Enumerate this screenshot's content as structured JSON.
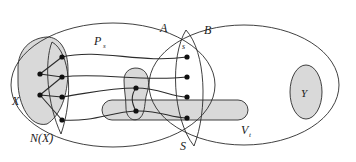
{
  "figure": {
    "type": "diagram",
    "width": 356,
    "height": 162,
    "background": "#ffffff"
  },
  "colors": {
    "stroke": "#2b2b2b",
    "fill_shaded": "#d9d9d9",
    "fill_none": "none",
    "vertex": "#111111",
    "label": "#1a1a1a"
  },
  "labels": {
    "set_a": "A",
    "set_b": "B",
    "set_x": "X",
    "set_nx": "N(X)",
    "set_s": "S",
    "set_y": "Y",
    "path_ps": "P",
    "path_ps_sub": "s",
    "vertex_s": "s",
    "set_vt": "V",
    "set_vt_sub": "t"
  },
  "regions": [
    {
      "id": "A",
      "label": "A",
      "shape": "ellipse",
      "shaded": false
    },
    {
      "id": "B",
      "label": "B",
      "shape": "ellipse",
      "shaded": false
    },
    {
      "id": "X",
      "label": "X",
      "shape": "blob",
      "shaded": true
    },
    {
      "id": "N(X)",
      "label": "N(X)",
      "shape": "lens",
      "shaded": false
    },
    {
      "id": "S",
      "label": "S",
      "shape": "lens",
      "shaded": false
    },
    {
      "id": "Y",
      "label": "Y",
      "shape": "ellipse",
      "shaded": true
    },
    {
      "id": "Vt",
      "label": "V",
      "sub": "t",
      "shape": "capsule",
      "shaded": true
    },
    {
      "id": "middle-blob",
      "label": "",
      "shape": "blob",
      "shaded": true
    }
  ],
  "vertices": {
    "left_column": [
      {
        "cx": 40,
        "cy": 74
      },
      {
        "cx": 40,
        "cy": 95
      }
    ],
    "nx_column": [
      {
        "cx": 62,
        "cy": 57
      },
      {
        "cx": 62,
        "cy": 77
      },
      {
        "cx": 62,
        "cy": 97
      },
      {
        "cx": 62,
        "cy": 120
      }
    ],
    "middle_column": [
      {
        "cx": 136,
        "cy": 88
      },
      {
        "cx": 136,
        "cy": 111
      }
    ],
    "right_column": [
      {
        "cx": 187,
        "cy": 57,
        "label": "s"
      },
      {
        "cx": 187,
        "cy": 77
      },
      {
        "cx": 187,
        "cy": 97
      },
      {
        "cx": 187,
        "cy": 118
      }
    ]
  },
  "paths": [
    {
      "id": "P_s",
      "label": "P",
      "sub": "s",
      "from": "nx_column.0",
      "to": "right_column.0"
    },
    {
      "id": "p2",
      "from": "nx_column.1",
      "to": "right_column.1"
    },
    {
      "id": "p3",
      "from": "nx_column.2",
      "to": "right_column.2"
    },
    {
      "id": "p4",
      "from": "nx_column.3",
      "to": "right_column.3"
    }
  ]
}
